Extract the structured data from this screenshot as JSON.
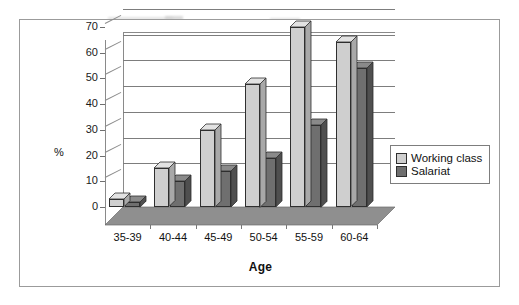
{
  "chart_data": {
    "type": "bar",
    "title": "",
    "subtitle": "",
    "xlabel": "Age",
    "ylabel": "%",
    "categories": [
      "35-39",
      "40-44",
      "45-49",
      "50-54",
      "55-59",
      "60-64"
    ],
    "series": [
      {
        "name": "Working class",
        "values": [
          3,
          15,
          30,
          48,
          70,
          64
        ],
        "color": "#cfcfcf"
      },
      {
        "name": "Salariat",
        "values": [
          2,
          10,
          14,
          19,
          32,
          54
        ],
        "color": "#6f6f6f"
      }
    ],
    "ylim": [
      0,
      70
    ],
    "ytick_step": 10,
    "yticks": [
      "70",
      "60",
      "50",
      "40",
      "30",
      "20",
      "10",
      "0"
    ],
    "grid": true,
    "grid_orientation": "horizontal",
    "legend_position": "right",
    "style": "3d-clustered-column",
    "background": "#ffffff",
    "frame_color": "#9b9b9b"
  },
  "axis": {
    "y_title": "%",
    "x_title": "Age"
  },
  "legend": {
    "entries": [
      {
        "label": "Working class",
        "swatch": "#cfcfcf"
      },
      {
        "label": "Salariat",
        "swatch": "#6f6f6f"
      }
    ]
  },
  "ticks": {
    "y": [
      "70",
      "60",
      "50",
      "40",
      "30",
      "20",
      "10",
      "0"
    ],
    "x": [
      "35-39",
      "40-44",
      "45-49",
      "50-54",
      "55-59",
      "60-64"
    ]
  }
}
